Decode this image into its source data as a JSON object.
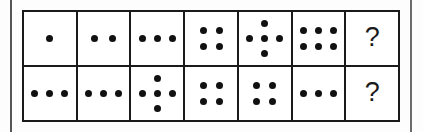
{
  "figure": {
    "kind": "dot-pattern-sequence-puzzle",
    "rows": 2,
    "columns": 7,
    "unknown_label": "?",
    "ink_color": "#111111",
    "border_color": "#1a1a1a",
    "background_color": "#ffffff"
  },
  "grid": {
    "rows": [
      {
        "name": "row-top",
        "cells": [
          {
            "name": "r1c1",
            "type": "dots",
            "count": 1,
            "arrangement": "single",
            "label": "1"
          },
          {
            "name": "r1c2",
            "type": "dots",
            "count": 2,
            "arrangement": "row",
            "label": "2"
          },
          {
            "name": "r1c3",
            "type": "dots",
            "count": 3,
            "arrangement": "row",
            "label": "3"
          },
          {
            "name": "r1c4",
            "type": "dots",
            "count": 4,
            "arrangement": "square",
            "label": "4"
          },
          {
            "name": "r1c5",
            "type": "dots",
            "count": 5,
            "arrangement": "quincunx",
            "label": "5"
          },
          {
            "name": "r1c6",
            "type": "dots",
            "count": 6,
            "arrangement": "grid-3x2",
            "label": "6"
          },
          {
            "name": "r1c7",
            "type": "unknown",
            "count": 0,
            "arrangement": "none",
            "label": "?"
          }
        ]
      },
      {
        "name": "row-bottom",
        "cells": [
          {
            "name": "r2c1",
            "type": "dots",
            "count": 3,
            "arrangement": "row",
            "label": "3"
          },
          {
            "name": "r2c2",
            "type": "dots",
            "count": 3,
            "arrangement": "row",
            "label": "3"
          },
          {
            "name": "r2c3",
            "type": "dots",
            "count": 5,
            "arrangement": "quincunx",
            "label": "5"
          },
          {
            "name": "r2c4",
            "type": "dots",
            "count": 4,
            "arrangement": "square",
            "label": "4"
          },
          {
            "name": "r2c5",
            "type": "dots",
            "count": 4,
            "arrangement": "square",
            "label": "4"
          },
          {
            "name": "r2c6",
            "type": "dots",
            "count": 3,
            "arrangement": "row",
            "label": "3"
          },
          {
            "name": "r2c7",
            "type": "unknown",
            "count": 0,
            "arrangement": "none",
            "label": "?"
          }
        ]
      }
    ]
  },
  "dot_layouts": {
    "single": [
      [
        23,
        20
      ]
    ],
    "row2": [
      [
        14,
        20
      ],
      [
        32,
        20
      ]
    ],
    "row3": [
      [
        8,
        20
      ],
      [
        23,
        20
      ],
      [
        38,
        20
      ]
    ],
    "square": [
      [
        15,
        12
      ],
      [
        31,
        12
      ],
      [
        15,
        28
      ],
      [
        31,
        28
      ]
    ],
    "quincunx": [
      [
        23,
        5
      ],
      [
        8,
        20
      ],
      [
        23,
        20
      ],
      [
        38,
        20
      ],
      [
        23,
        35
      ]
    ],
    "grid3x2": [
      [
        8,
        12
      ],
      [
        23,
        12
      ],
      [
        38,
        12
      ],
      [
        8,
        28
      ],
      [
        23,
        28
      ],
      [
        38,
        28
      ]
    ]
  }
}
